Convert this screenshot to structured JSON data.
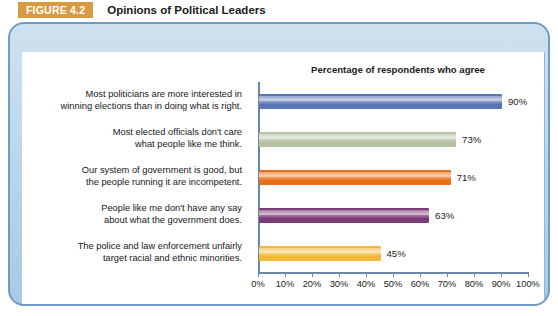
{
  "header": {
    "badge": "FIGURE 4.2",
    "title": "Opinions of Political Leaders",
    "badge_color": "#d79b43"
  },
  "panel": {
    "border_color": "#6e9cc4",
    "background_color": "#bcd7ec"
  },
  "chart_data": {
    "type": "bar",
    "orientation": "horizontal",
    "title": "Percentage of respondents who agree",
    "xlabel": "",
    "ylabel": "",
    "xlim": [
      0,
      100
    ],
    "grid": false,
    "legend": "none",
    "tick_labels": [
      "0%",
      "10%",
      "20%",
      "30%",
      "40%",
      "50%",
      "60%",
      "70%",
      "80%",
      "90%",
      "100%"
    ],
    "tick_values": [
      0,
      10,
      20,
      30,
      40,
      50,
      60,
      70,
      80,
      90,
      100
    ],
    "categories": [
      "Most politicians are more interested in\nwinning elections than in doing what is right.",
      "Most elected officials don't care\nwhat people like me think.",
      "Our system of government is good, but\nthe people running it are incompetent.",
      "People like me don't have any say\nabout what the government does.",
      "The police and law enforcement unfairly\ntarget racial and ethnic minorities."
    ],
    "values": [
      90,
      73,
      71,
      63,
      45
    ],
    "value_labels": [
      "90%",
      "73%",
      "71%",
      "63%",
      "45%"
    ],
    "bar_colors": [
      "#5a75b4",
      "#b3c2a3",
      "#e8701a",
      "#7c3c77",
      "#f2b938"
    ]
  }
}
